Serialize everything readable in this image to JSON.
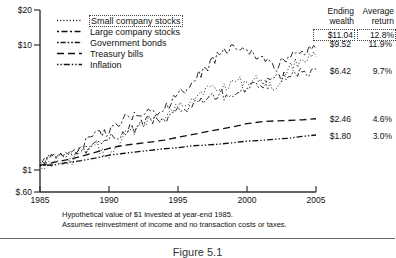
{
  "chart_data": {
    "type": "line",
    "title": "",
    "xlabel": "",
    "ylabel": "",
    "scale": "log",
    "grid": false,
    "legend_position": "top-left",
    "xlim": [
      1985,
      2005
    ],
    "ylim": [
      0.6,
      20
    ],
    "x_ticks": [
      "1985",
      "1990",
      "1995",
      "2000",
      "2005"
    ],
    "y_ticks": [
      "$20",
      "$10",
      "$1",
      "$.60"
    ],
    "y_tick_values": [
      20,
      10,
      1,
      0.6
    ],
    "x": [
      1985,
      1986,
      1987,
      1988,
      1989,
      1990,
      1991,
      1992,
      1993,
      1994,
      1995,
      1996,
      1997,
      1998,
      1999,
      2000,
      2001,
      2002,
      2003,
      2004,
      2005
    ],
    "series": [
      {
        "name": "Small company stocks",
        "dash": "dotted",
        "ending_wealth": "$11.04",
        "average_return": "12.8%",
        "highlighted": true,
        "values": [
          1.0,
          1.07,
          1.02,
          1.3,
          1.48,
          1.15,
          1.72,
          2.08,
          2.46,
          2.42,
          3.1,
          3.66,
          4.46,
          4.29,
          5.09,
          4.97,
          5.28,
          4.28,
          6.5,
          7.73,
          8.1
        ]
      },
      {
        "name": "Large company stocks",
        "dash": "dash-dash",
        "ending_wealth": "$9.52",
        "average_return": "11.9%",
        "highlighted": false,
        "values": [
          1.0,
          1.19,
          1.25,
          1.46,
          1.92,
          1.86,
          2.43,
          2.61,
          2.87,
          2.91,
          4.0,
          4.92,
          6.56,
          8.43,
          10.2,
          9.27,
          8.17,
          6.36,
          8.19,
          9.08,
          9.52
        ]
      },
      {
        "name": "Government bonds",
        "dash": "dash-dot",
        "ending_wealth": "$6.42",
        "average_return": "9.7%",
        "highlighted": false,
        "values": [
          1.0,
          1.24,
          1.21,
          1.33,
          1.57,
          1.65,
          1.92,
          2.08,
          2.47,
          2.38,
          3.09,
          3.06,
          3.5,
          3.99,
          3.76,
          4.44,
          4.66,
          5.45,
          5.54,
          6.04,
          6.42
        ]
      },
      {
        "name": "Treasury bills",
        "dash": "long-dash",
        "ending_wealth": "$2.46",
        "average_return": "4.6%",
        "highlighted": false,
        "values": [
          1.0,
          1.06,
          1.12,
          1.19,
          1.29,
          1.39,
          1.47,
          1.52,
          1.57,
          1.63,
          1.72,
          1.81,
          1.91,
          2.01,
          2.11,
          2.24,
          2.32,
          2.36,
          2.38,
          2.41,
          2.46
        ]
      },
      {
        "name": "Inflation",
        "dash": "dash-dot-dot",
        "ending_wealth": "$1.80",
        "average_return": "3.0%",
        "highlighted": false,
        "values": [
          1.0,
          1.01,
          1.06,
          1.1,
          1.15,
          1.22,
          1.26,
          1.3,
          1.34,
          1.38,
          1.41,
          1.46,
          1.48,
          1.51,
          1.55,
          1.6,
          1.62,
          1.66,
          1.69,
          1.75,
          1.8
        ]
      }
    ]
  },
  "columns": {
    "ending_wealth_header": "Ending\nwealth",
    "ending_wealth_l1": "Ending",
    "ending_wealth_l2": "wealth",
    "average_return_l1": "Average",
    "average_return_l2": "return"
  },
  "caption": {
    "line1": "Hypothetical value of $1 invested at year-end 1985.",
    "line2": "Assumes reinvestment of income and no transaction costs or taxes."
  },
  "figure_caption": "Figure 5.1"
}
